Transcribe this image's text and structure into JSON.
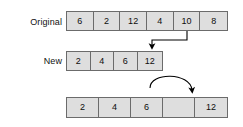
{
  "diagram": {
    "background_color": "#ffffff",
    "cell_fill_color": "#dedede",
    "cell_border_color": "#6b6b6b",
    "text_color": "#0d0d0d",
    "arrow_color": "#000000",
    "rows": [
      {
        "id": "original",
        "label": "Original",
        "cells": [
          "6",
          "2",
          "12",
          "4",
          "10",
          "8"
        ]
      },
      {
        "id": "new",
        "label": "New",
        "cells": [
          "2",
          "4",
          "6",
          "12"
        ]
      },
      {
        "id": "shifted",
        "label": "",
        "cells": [
          "2",
          "4",
          "6",
          "",
          "12"
        ]
      }
    ],
    "arrows": [
      {
        "id": "select-10-arrow",
        "kind": "elbow",
        "description": "From under cell 10 of the Original row, left then down into the New row"
      },
      {
        "id": "shift-12-arrow",
        "kind": "curved",
        "description": "Curved arrow from the 12 cell of the New row to the 12 cell of the shifted row"
      }
    ]
  }
}
